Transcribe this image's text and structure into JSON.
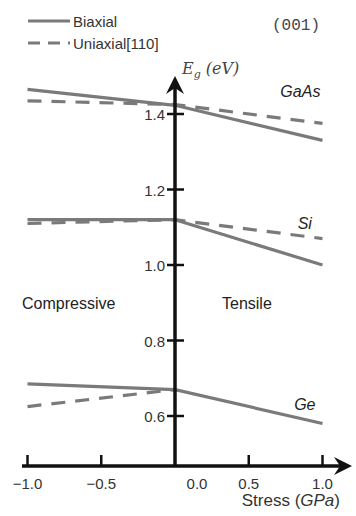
{
  "chart_data": {
    "type": "line",
    "title": "",
    "annotation_orientation": "(001)",
    "xlabel": "Stress (GPa)",
    "xlabel_parts": {
      "prefix": "Stress (",
      "unit": "GPa",
      "suffix": ")"
    },
    "ylabel": "E_g (eV)",
    "ylabel_parts": {
      "symbol": "E",
      "subscript": "g",
      "unit": "(eV)"
    },
    "xlim": [
      -1.0,
      1.0
    ],
    "ylim": [
      0.55,
      1.5
    ],
    "x_ticks": [
      "-1.0",
      "-0.5",
      "0.0",
      "0.5",
      "1.0"
    ],
    "y_ticks": [
      "0.6",
      "0.8",
      "1.0",
      "1.2",
      "1.4"
    ],
    "grid": false,
    "legend": {
      "position": "top-left",
      "entries": [
        {
          "label": "Biaxial",
          "style": "solid"
        },
        {
          "label": "Uniaxial[110]",
          "style": "dashed"
        }
      ]
    },
    "region_labels": {
      "left": "Compressive",
      "right": "Tensile"
    },
    "series": [
      {
        "name": "GaAs Biaxial",
        "material": "GaAs",
        "strain": "Biaxial",
        "style": "solid",
        "x": [
          -1.0,
          0.0,
          1.0
        ],
        "values": [
          1.465,
          1.423,
          1.33
        ]
      },
      {
        "name": "GaAs Uniaxial[110]",
        "material": "GaAs",
        "strain": "Uniaxial[110]",
        "style": "dashed",
        "x": [
          -1.0,
          0.0,
          1.0
        ],
        "values": [
          1.435,
          1.425,
          1.375
        ]
      },
      {
        "name": "Si Biaxial",
        "material": "Si",
        "strain": "Biaxial",
        "style": "solid",
        "x": [
          -1.0,
          0.0,
          1.0
        ],
        "values": [
          1.12,
          1.12,
          1.0
        ]
      },
      {
        "name": "Si Uniaxial[110]",
        "material": "Si",
        "strain": "Uniaxial[110]",
        "style": "dashed",
        "x": [
          -1.0,
          0.0,
          1.0
        ],
        "values": [
          1.11,
          1.12,
          1.07
        ]
      },
      {
        "name": "Ge Biaxial",
        "material": "Ge",
        "strain": "Biaxial",
        "style": "solid",
        "x": [
          -1.0,
          0.0,
          1.0
        ],
        "values": [
          0.685,
          0.67,
          0.58
        ]
      },
      {
        "name": "Ge Uniaxial[110]",
        "material": "Ge",
        "strain": "Uniaxial[110]",
        "style": "dashed",
        "x": [
          -1.0,
          0.0
        ],
        "values": [
          0.625,
          0.67
        ]
      }
    ],
    "material_labels": [
      {
        "text": "GaAs",
        "x": 0.85,
        "y": 1.445
      },
      {
        "text": "Si",
        "x": 0.88,
        "y": 1.095
      },
      {
        "text": "Ge",
        "x": 0.88,
        "y": 0.615
      }
    ],
    "colors": {
      "axis": "#111111",
      "series": "#7a7a7a",
      "text": "#333333"
    }
  }
}
